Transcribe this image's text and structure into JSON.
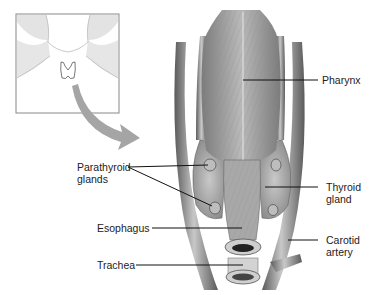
{
  "diagram": {
    "inset": {
      "description": "neck locator showing thyroid position"
    },
    "labels": {
      "pharynx": "Pharynx",
      "parathyroid": "Parathyroid\nglands",
      "thyroid": "Thyroid\ngland",
      "esophagus": "Esophagus",
      "carotid": "Carotid\nartery",
      "trachea": "Trachea"
    },
    "colors": {
      "tissue": "#a9a9a9",
      "tissue_dark": "#6e6e6e",
      "arrow": "#9a9a9a",
      "line": "#111111"
    }
  }
}
